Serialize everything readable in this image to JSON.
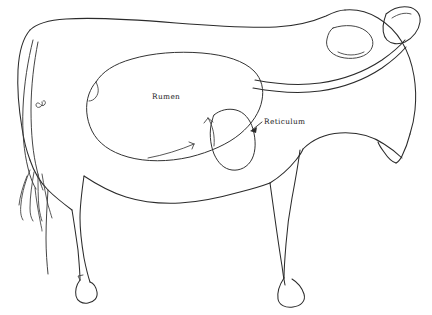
{
  "figure": {
    "view": "left lateral outline",
    "background_color": "#ffffff",
    "line_color": "#2b2b2b"
  },
  "labels": [
    {
      "id": "rumen",
      "text": "Rumen",
      "x": 152,
      "y": 99,
      "has_leader": false
    },
    {
      "id": "reticulum",
      "text": "Reticulum",
      "x": 264,
      "y": 124,
      "has_leader": true
    }
  ],
  "organs": [
    {
      "id": "rumen-outline",
      "name": "Rumen"
    },
    {
      "id": "reticulum-outline",
      "name": "Reticulum"
    }
  ],
  "body_parts": [
    {
      "id": "body-outline",
      "name": "body"
    },
    {
      "id": "head",
      "name": "head"
    },
    {
      "id": "ear",
      "name": "ear"
    },
    {
      "id": "shoulder-blade",
      "name": "shoulder blade"
    },
    {
      "id": "neck-fold",
      "name": "neck fold"
    },
    {
      "id": "tail",
      "name": "tail"
    },
    {
      "id": "tail-tuft",
      "name": "tail tuft"
    },
    {
      "id": "foreleg",
      "name": "foreleg"
    },
    {
      "id": "hindleg",
      "name": "hindleg"
    },
    {
      "id": "hip-mark",
      "name": "hip mark"
    }
  ]
}
